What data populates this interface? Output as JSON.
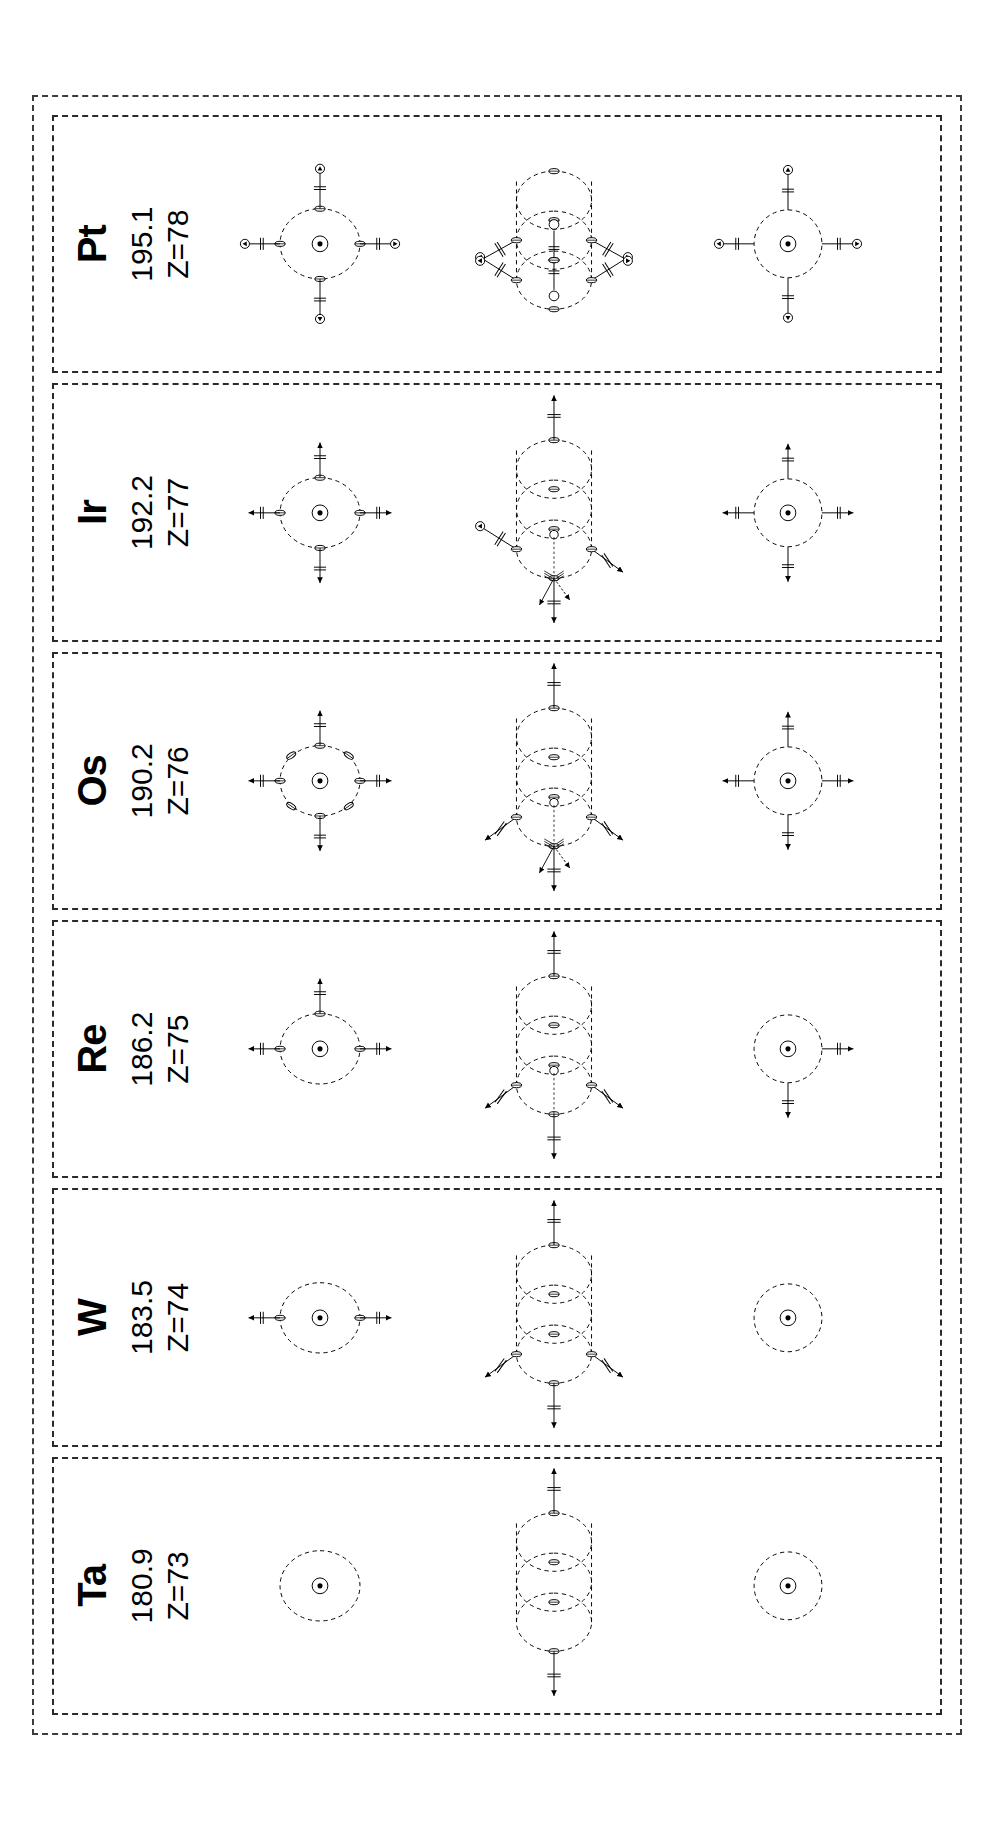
{
  "figure": {
    "orientation": "rotated-90-ccw",
    "outer_border_style": "dashed",
    "panel_border_style": "dashed",
    "line_color": "#000000",
    "border_color": "#2a2a2a",
    "background": "#ffffff"
  },
  "elements": [
    {
      "symbol": "Ta",
      "atomic_mass": "180.9",
      "atomic_number_label": "Z=73",
      "atomic_number": 73,
      "diagram_a": {
        "kind": "single-loop-core",
        "loops": 1,
        "arms": [],
        "nucleus": true,
        "side_markers": 0
      },
      "diagram_b": {
        "kind": "loop-chain",
        "loops": 3,
        "equator_nodes": 4,
        "left_arrow": true,
        "right_arrow": true,
        "arm_upper_left": false,
        "arm_lower_left": false,
        "top_pair": false
      },
      "diagram_c": {
        "kind": "plain-circle",
        "arms": []
      }
    },
    {
      "symbol": "W",
      "atomic_mass": "183.5",
      "atomic_number_label": "Z=74",
      "atomic_number": 74,
      "diagram_a": {
        "kind": "single-loop-core",
        "loops": 1,
        "arms": [
          "up",
          "down"
        ],
        "nucleus": true,
        "side_markers": 0
      },
      "diagram_b": {
        "kind": "loop-chain",
        "loops": 3,
        "equator_nodes": 4,
        "left_arrow": true,
        "right_arrow": true,
        "arm_upper_left": true,
        "arm_lower_left": true,
        "top_pair": false
      },
      "diagram_c": {
        "kind": "plain-circle",
        "arms": []
      }
    },
    {
      "symbol": "Re",
      "atomic_mass": "186.2",
      "atomic_number_label": "Z=75",
      "atomic_number": 75,
      "diagram_a": {
        "kind": "single-loop-core",
        "loops": 1,
        "arms": [
          "up",
          "down",
          "right"
        ],
        "nucleus": true,
        "side_markers": 0
      },
      "diagram_b": {
        "kind": "loop-chain",
        "loops": 3,
        "equator_nodes": 4,
        "left_arrow": true,
        "right_arrow": true,
        "arm_upper_left": true,
        "arm_lower_left": true,
        "top_pair": false,
        "inner_small_ring": true
      },
      "diagram_c": {
        "kind": "circle-with-arms",
        "arms": [
          "left",
          "down"
        ]
      }
    },
    {
      "symbol": "Os",
      "atomic_mass": "190.2",
      "atomic_number_label": "Z=76",
      "atomic_number": 76,
      "diagram_a": {
        "kind": "single-loop-core",
        "loops": 1,
        "arms": [
          "up",
          "down",
          "left",
          "right"
        ],
        "nucleus": true,
        "side_markers": 4
      },
      "diagram_b": {
        "kind": "loop-chain",
        "loops": 3,
        "equator_nodes": 4,
        "left_arrow": true,
        "right_arrow": true,
        "arm_upper_left": true,
        "arm_lower_left": true,
        "top_pair": false,
        "inner_small_ring": true,
        "fan_arrows": true
      },
      "diagram_c": {
        "kind": "circle-with-arms",
        "arms": [
          "left",
          "right",
          "up",
          "down"
        ]
      }
    },
    {
      "symbol": "Ir",
      "atomic_mass": "192.2",
      "atomic_number_label": "Z=77",
      "atomic_number": 77,
      "diagram_a": {
        "kind": "single-loop-core",
        "loops": 1,
        "arms": [
          "up",
          "down",
          "left",
          "right"
        ],
        "nucleus": true,
        "side_markers": 0,
        "arrow_tips": true
      },
      "diagram_b": {
        "kind": "loop-chain",
        "loops": 3,
        "equator_nodes": 4,
        "left_arrow": true,
        "right_arrow": true,
        "arm_upper_left": true,
        "arm_lower_left": true,
        "top_pair": true,
        "inner_small_ring": true,
        "fan_arrows": true
      },
      "diagram_c": {
        "kind": "circle-with-arms",
        "arms": [
          "left",
          "right",
          "up",
          "down"
        ]
      }
    },
    {
      "symbol": "Pt",
      "atomic_mass": "195.1",
      "atomic_number_label": "Z=78",
      "atomic_number": 78,
      "diagram_a": {
        "kind": "single-loop-core",
        "loops": 1,
        "arms": [
          "up",
          "down",
          "left",
          "right"
        ],
        "nucleus": true,
        "side_markers": 0,
        "arrow_tips": true,
        "terminal_circles": true
      },
      "diagram_b": {
        "kind": "loop-chain",
        "loops": 3,
        "equator_nodes": 4,
        "left_arrow": false,
        "right_arrow": false,
        "arm_upper_left": true,
        "arm_upper_right": true,
        "arm_lower_left": true,
        "arm_lower_right": true,
        "top_pair": true,
        "bottom_pair": true,
        "terminal_circles": true
      },
      "diagram_c": {
        "kind": "circle-with-arms",
        "arms": [
          "left",
          "right",
          "up",
          "down"
        ],
        "terminal_circles": true
      }
    }
  ],
  "chart_data": {
    "type": "table",
    "categories": [
      "Ta",
      "W",
      "Re",
      "Os",
      "Ir",
      "Pt"
    ],
    "series": [
      {
        "name": "Atomic mass",
        "values": [
          180.9,
          183.5,
          186.2,
          190.2,
          192.2,
          195.1
        ]
      },
      {
        "name": "Atomic number Z",
        "values": [
          73,
          74,
          75,
          76,
          77,
          78
        ]
      },
      {
        "name": "Diagram A arms",
        "values": [
          0,
          2,
          3,
          4,
          4,
          4
        ]
      },
      {
        "name": "Diagram B loops",
        "values": [
          3,
          3,
          3,
          3,
          3,
          3
        ]
      },
      {
        "name": "Diagram C arms",
        "values": [
          0,
          0,
          2,
          4,
          4,
          4
        ]
      }
    ],
    "xlabel": "Element",
    "ylabel": "",
    "grid": false,
    "legend_position": "none"
  }
}
